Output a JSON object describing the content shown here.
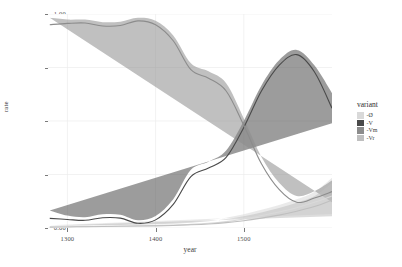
{
  "chart_data": {
    "type": "line",
    "title": "",
    "xlabel": "year",
    "ylabel": "rate",
    "xlim": [
      1278,
      1600
    ],
    "ylim": [
      0.0,
      1.0
    ],
    "grid": true,
    "legend_position": "right",
    "legend_title": "variant",
    "xticks": [
      1300,
      1400,
      1500
    ],
    "xtick_labels": [
      "1300",
      "1400",
      "1500"
    ],
    "yticks": [
      0.0,
      0.25,
      0.5,
      0.75,
      1.0
    ],
    "ytick_labels": [
      "0.00",
      "0.25",
      "0.50",
      "0.75",
      "1.00"
    ],
    "x": [
      1280,
      1300,
      1320,
      1340,
      1360,
      1380,
      1400,
      1420,
      1440,
      1460,
      1480,
      1500,
      1520,
      1540,
      1560,
      1580,
      1600
    ],
    "series": [
      {
        "name": "-Ø",
        "color": "#d9d9d9",
        "values": [
          0.005,
          0.006,
          0.007,
          0.008,
          0.009,
          0.01,
          0.012,
          0.014,
          0.017,
          0.022,
          0.03,
          0.042,
          0.058,
          0.075,
          0.095,
          0.12,
          0.15
        ],
        "lower": [
          0.0,
          0.001,
          0.002,
          0.003,
          0.004,
          0.004,
          0.005,
          0.006,
          0.008,
          0.011,
          0.016,
          0.024,
          0.034,
          0.046,
          0.06,
          0.078,
          0.065
        ],
        "upper": [
          0.013,
          0.013,
          0.013,
          0.014,
          0.015,
          0.017,
          0.02,
          0.024,
          0.029,
          0.037,
          0.048,
          0.064,
          0.085,
          0.108,
          0.134,
          0.168,
          0.235
        ]
      },
      {
        "name": "-V",
        "color": "#4a4a4a",
        "values": [
          0.045,
          0.04,
          0.036,
          0.048,
          0.046,
          0.022,
          0.038,
          0.11,
          0.24,
          0.28,
          0.33,
          0.47,
          0.64,
          0.76,
          0.81,
          0.73,
          0.56
        ],
        "lower": [
          0.018,
          0.024,
          0.024,
          0.034,
          0.032,
          0.012,
          0.024,
          0.09,
          0.21,
          0.252,
          0.3,
          0.442,
          0.614,
          0.737,
          0.789,
          0.7,
          0.49
        ],
        "upper": [
          0.082,
          0.058,
          0.05,
          0.064,
          0.062,
          0.036,
          0.056,
          0.134,
          0.272,
          0.31,
          0.362,
          0.5,
          0.666,
          0.784,
          0.832,
          0.76,
          0.63
        ]
      },
      {
        "name": "-Vm",
        "color": "#8c8c8c",
        "values": [
          0.95,
          0.956,
          0.958,
          0.944,
          0.946,
          0.968,
          0.95,
          0.875,
          0.74,
          0.7,
          0.64,
          0.48,
          0.3,
          0.18,
          0.12,
          0.14,
          0.17
        ],
        "lower": [
          0.905,
          0.935,
          0.94,
          0.926,
          0.926,
          0.955,
          0.932,
          0.85,
          0.71,
          0.668,
          0.604,
          0.448,
          0.268,
          0.15,
          0.093,
          0.11,
          0.12
        ],
        "upper": [
          0.982,
          0.974,
          0.974,
          0.962,
          0.964,
          0.982,
          0.968,
          0.9,
          0.77,
          0.732,
          0.676,
          0.512,
          0.332,
          0.212,
          0.15,
          0.172,
          0.222
        ]
      },
      {
        "name": "-Vr",
        "color": "#bfbfbf",
        "values": [
          0.004,
          0.005,
          0.006,
          0.007,
          0.008,
          0.009,
          0.01,
          0.012,
          0.015,
          0.019,
          0.025,
          0.034,
          0.046,
          0.06,
          0.078,
          0.1,
          0.13
        ],
        "lower": [
          0.0,
          0.0,
          0.001,
          0.002,
          0.003,
          0.003,
          0.004,
          0.005,
          0.007,
          0.009,
          0.013,
          0.019,
          0.027,
          0.037,
          0.05,
          0.066,
          0.055
        ],
        "upper": [
          0.011,
          0.011,
          0.012,
          0.013,
          0.014,
          0.015,
          0.017,
          0.02,
          0.025,
          0.032,
          0.042,
          0.055,
          0.073,
          0.093,
          0.118,
          0.148,
          0.21
        ]
      }
    ]
  },
  "legend": {
    "title": "variant",
    "items": [
      {
        "label": "-Ø",
        "color": "#d9d9d9"
      },
      {
        "label": "-V",
        "color": "#4a4a4a"
      },
      {
        "label": "-Vm",
        "color": "#8c8c8c"
      },
      {
        "label": "-Vr",
        "color": "#bfbfbf"
      }
    ]
  },
  "axes": {
    "x_title": "year",
    "y_title": "rate"
  }
}
